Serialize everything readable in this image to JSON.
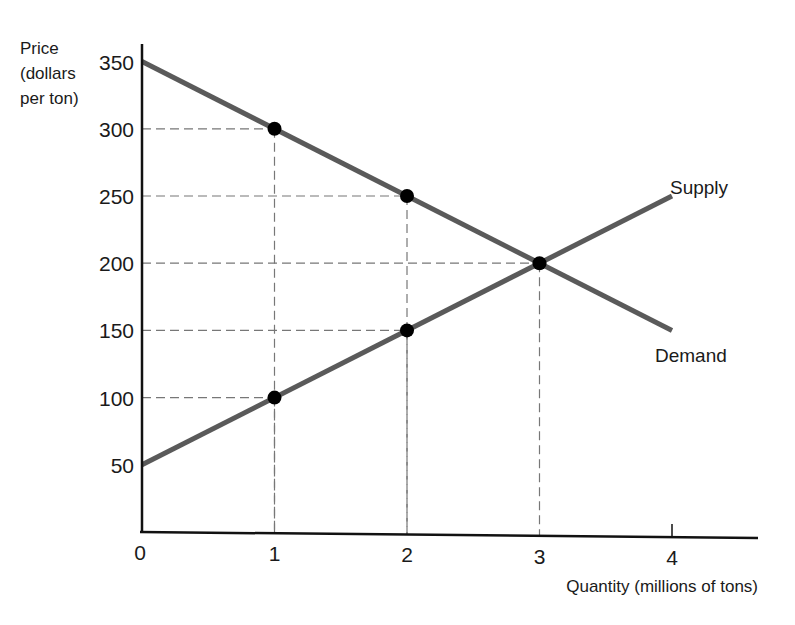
{
  "chart_data": {
    "type": "line",
    "title": "",
    "ylabel_lines": [
      "Price",
      "(dollars",
      "per ton)"
    ],
    "xlabel": "Quantity (millions of tons)",
    "x_ticks": [
      "0",
      "1",
      "2",
      "3",
      "4"
    ],
    "y_ticks": [
      "50",
      "100",
      "150",
      "200",
      "250",
      "300",
      "350"
    ],
    "xlim": [
      0,
      4.6
    ],
    "ylim": [
      0,
      370
    ],
    "grid": false,
    "series": [
      {
        "name": "Demand",
        "points": [
          [
            0,
            350
          ],
          [
            1,
            300
          ],
          [
            2,
            250
          ],
          [
            3,
            200
          ],
          [
            4,
            150
          ]
        ],
        "marked_points": [
          [
            1,
            300
          ],
          [
            2,
            250
          ],
          [
            3,
            200
          ]
        ],
        "color": "#5a5a5a"
      },
      {
        "name": "Supply",
        "points": [
          [
            0,
            50
          ],
          [
            1,
            100
          ],
          [
            2,
            150
          ],
          [
            3,
            200
          ],
          [
            4,
            250
          ]
        ],
        "marked_points": [
          [
            1,
            100
          ],
          [
            2,
            150
          ],
          [
            3,
            200
          ]
        ],
        "color": "#5a5a5a"
      }
    ],
    "annotations": [
      {
        "text": "Supply",
        "at": [
          4,
          250
        ]
      },
      {
        "text": "Demand",
        "at": [
          4,
          150
        ]
      }
    ],
    "equilibrium": {
      "quantity": 3,
      "price": 200
    }
  }
}
